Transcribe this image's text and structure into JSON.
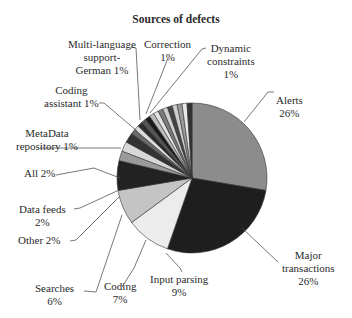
{
  "chart_data": {
    "type": "pie",
    "title": "Sources of defects",
    "slices": [
      {
        "label": "Alerts",
        "value": 26,
        "color": "#8c8c8c"
      },
      {
        "label": "Major transactions",
        "value": 26,
        "color": "#1e1e1e"
      },
      {
        "label": "Input parsing",
        "value": 9,
        "color": "#ececec"
      },
      {
        "label": "Coding",
        "value": 7,
        "color": "#c4c4c4"
      },
      {
        "label": "Searches",
        "value": 6,
        "color": "#222222"
      },
      {
        "label": "Other",
        "value": 2,
        "color": "#9a9a9a"
      },
      {
        "label": "Data feeds",
        "value": 2,
        "color": "#d8d8d8"
      },
      {
        "label": "All",
        "value": 2,
        "color": "#333333"
      },
      {
        "label": "MetaData repository",
        "value": 1,
        "color": "#6a6a6a"
      },
      {
        "label": "Coding assistant",
        "value": 1,
        "color": "#dcdcdc"
      },
      {
        "label": "Multi-language support-German",
        "value": 1,
        "color": "#2b2b2b"
      },
      {
        "label": "Correction",
        "value": 1,
        "color": "#555555"
      },
      {
        "label": "Dynamic constraints",
        "value": 1,
        "color": "#1a1a1a"
      },
      {
        "label": "(unlabeled minor sources)",
        "value": 9,
        "color": "#b5b5b5"
      }
    ],
    "legend": "none (leader-line labels)"
  },
  "labels": {
    "title": "Sources of defects",
    "multi_language_1": "Multi-language",
    "multi_language_2": "support-",
    "multi_language_3": "German 1%",
    "correction_1": "Correction",
    "correction_2": "1%",
    "dynamic_1": "Dynamic",
    "dynamic_2": "constraints",
    "dynamic_3": "1%",
    "coding_assistant_1": "Coding",
    "coding_assistant_2": "assistant 1%",
    "alerts_1": "Alerts",
    "alerts_2": "26%",
    "metadata_1": "MetaData",
    "metadata_2": "repository 1%",
    "all": "All 2%",
    "data_feeds_1": "Data feeds",
    "data_feeds_2": "2%",
    "other": "Other 2%",
    "searches_1": "Searches",
    "searches_2": "6%",
    "coding_1": "Coding",
    "coding_2": "7%",
    "input_1": "Input parsing",
    "input_2": "9%",
    "major_1": "Major",
    "major_2": "transactions",
    "major_3": "26%"
  }
}
